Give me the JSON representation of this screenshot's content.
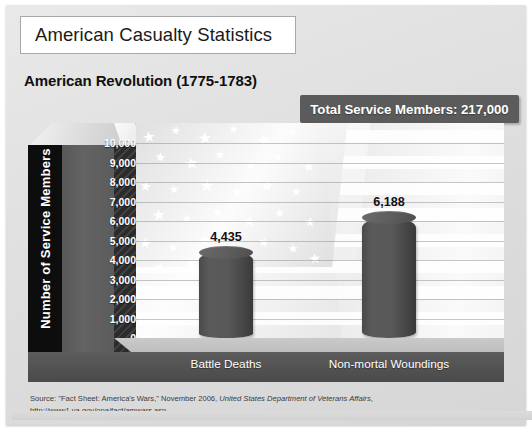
{
  "slide": {
    "title": "American Casualty Statistics",
    "chart_heading": "American Revolution (1775-1783)",
    "callout": "Total Service Members: 217,000",
    "source_line1_pre": "Source: \"Fact Sheet: America's Wars,\" November 2006, ",
    "source_line1_italic": "United States Department of Veterans Affairs",
    "source_line1_post": ",",
    "source_line2": "http://www1.va.gov/opa/fact/amwars.asp.",
    "colors": {
      "slide_background": "#e2e2e2",
      "title_box_background": "#ffffff",
      "callout_background": "#5b5b5b",
      "axis_panel_background": "#0d0d0d",
      "scale_panel_background": "#5f5f5f",
      "floor_front": "#515151",
      "bar_fill": "#4f4f4f",
      "plot_background": "#fbfbfb"
    }
  },
  "chart_data": {
    "type": "bar",
    "title": "American Revolution (1775-1783)",
    "subtitle": "American Casualty Statistics",
    "categories": [
      "Battle Deaths",
      "Non-mortal Woundings"
    ],
    "values": [
      4435,
      6188
    ],
    "value_labels": [
      "4,435",
      "6,188"
    ],
    "xlabel": "",
    "ylabel": "Number of Service Members",
    "ylim": [
      0,
      10000
    ],
    "ytick_step": 1000,
    "ytick_labels": [
      "10,000",
      "9,000",
      "8,000",
      "7,000",
      "6,000",
      "5,000",
      "4,000",
      "3,000",
      "2,000",
      "1,000",
      "0"
    ],
    "grid": true,
    "legend": "none",
    "annotations": [
      "Total Service Members: 217,000"
    ],
    "style": "3d-cylinder bars on a faded American flag backdrop"
  },
  "stars": [
    {
      "x": 6,
      "y": 6,
      "s": 15,
      "r": -8
    },
    {
      "x": 34,
      "y": 2,
      "s": 12,
      "r": 6
    },
    {
      "x": 62,
      "y": 8,
      "s": 16,
      "r": -4
    },
    {
      "x": 93,
      "y": 1,
      "s": 11,
      "r": 10
    },
    {
      "x": 120,
      "y": 9,
      "s": 17,
      "r": -6
    },
    {
      "x": 151,
      "y": 3,
      "s": 12,
      "r": 4
    },
    {
      "x": 18,
      "y": 28,
      "s": 13,
      "r": 5
    },
    {
      "x": 48,
      "y": 33,
      "s": 16,
      "r": -9
    },
    {
      "x": 78,
      "y": 26,
      "s": 12,
      "r": 7
    },
    {
      "x": 107,
      "y": 34,
      "s": 15,
      "r": -5
    },
    {
      "x": 137,
      "y": 28,
      "s": 12,
      "r": 8
    },
    {
      "x": 166,
      "y": 36,
      "s": 14,
      "r": -7
    },
    {
      "x": 4,
      "y": 56,
      "s": 14,
      "r": 9
    },
    {
      "x": 33,
      "y": 60,
      "s": 12,
      "r": -6
    },
    {
      "x": 63,
      "y": 54,
      "s": 17,
      "r": 3
    },
    {
      "x": 95,
      "y": 62,
      "s": 13,
      "r": -8
    },
    {
      "x": 125,
      "y": 55,
      "s": 15,
      "r": 6
    },
    {
      "x": 155,
      "y": 63,
      "s": 12,
      "r": -3
    },
    {
      "x": 16,
      "y": 84,
      "s": 16,
      "r": -5
    },
    {
      "x": 46,
      "y": 90,
      "s": 12,
      "r": 8
    },
    {
      "x": 76,
      "y": 82,
      "s": 14,
      "r": -4
    },
    {
      "x": 106,
      "y": 91,
      "s": 16,
      "r": 5
    },
    {
      "x": 138,
      "y": 84,
      "s": 12,
      "r": -9
    },
    {
      "x": 168,
      "y": 92,
      "s": 13,
      "r": 4
    },
    {
      "x": 3,
      "y": 112,
      "s": 15,
      "r": 7
    },
    {
      "x": 32,
      "y": 118,
      "s": 12,
      "r": -6
    },
    {
      "x": 61,
      "y": 110,
      "s": 16,
      "r": 3
    },
    {
      "x": 92,
      "y": 119,
      "s": 13,
      "r": -7
    },
    {
      "x": 122,
      "y": 112,
      "s": 14,
      "r": 8
    },
    {
      "x": 152,
      "y": 120,
      "s": 12,
      "r": -4
    },
    {
      "x": 18,
      "y": 138,
      "s": 13,
      "r": 6
    },
    {
      "x": 48,
      "y": 132,
      "s": 15,
      "r": -8
    },
    {
      "x": 110,
      "y": 136,
      "s": 12,
      "r": 5
    },
    {
      "x": 172,
      "y": 128,
      "s": 14,
      "r": -6
    }
  ]
}
